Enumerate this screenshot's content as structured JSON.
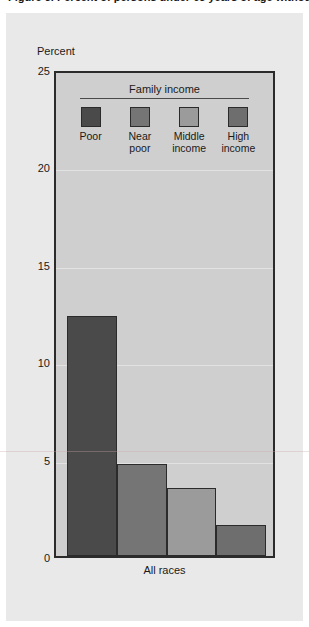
{
  "figure": {
    "title": "Figure 5. Percent of persons under 65 years of age without health insurance coverage, by family income",
    "panel_bg": "#e9e9e9",
    "plot_bg": "#cfcfcf",
    "frame_color": "#2b2b2b"
  },
  "legend": {
    "title": "Family income",
    "items": [
      {
        "label": "Poor",
        "label_line1": "Poor",
        "label_line2": "",
        "color": "#4a4a4a"
      },
      {
        "label": "Near poor",
        "label_line1": "Near",
        "label_line2": "poor",
        "color": "#757575"
      },
      {
        "label": "Middle income",
        "label_line1": "Middle",
        "label_line2": "income",
        "color": "#9b9b9b"
      },
      {
        "label": "High income",
        "label_line1": "High",
        "label_line2": "income",
        "color": "#6e6e6e"
      }
    ]
  },
  "axes": {
    "ylabel": "Percent",
    "yticks": [
      0,
      5,
      10,
      15,
      20,
      25
    ],
    "ylim": [
      0,
      25
    ],
    "xlabel": "All races"
  },
  "chart_data": {
    "type": "bar",
    "title": "Percent of persons under 65 years of age without health insurance coverage, by family income",
    "xlabel": "All races",
    "ylabel": "Percent",
    "ylim": [
      0,
      25
    ],
    "categories": [
      "All races"
    ],
    "grid": true,
    "legend_position": "top-inside",
    "series": [
      {
        "name": "Poor",
        "values": [
          12.3
        ],
        "color": "#4a4a4a"
      },
      {
        "name": "Near poor",
        "values": [
          4.7
        ],
        "color": "#757575"
      },
      {
        "name": "Middle income",
        "values": [
          3.5
        ],
        "color": "#9b9b9b"
      },
      {
        "name": "High income",
        "values": [
          1.6
        ],
        "color": "#6e6e6e"
      }
    ]
  }
}
